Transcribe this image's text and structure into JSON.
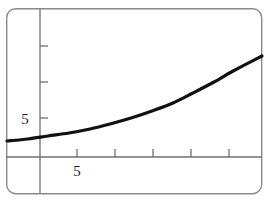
{
  "figure": {
    "frame": {
      "name": "rounded-figure-border",
      "x": 6,
      "y": 8,
      "width": 256,
      "height": 186,
      "radius": 9,
      "stroke": "#8a8a8a",
      "stroke_width": 1.4
    },
    "background": "#ffffff"
  },
  "chart_data": {
    "type": "line",
    "title": "",
    "subtitle": "",
    "xlabel": "",
    "ylabel": "",
    "grid": false,
    "legend": null,
    "annotations": [],
    "curve_color": "#111111",
    "curve_width": 3.2,
    "axis_color": "#6f6f6f",
    "axis_width": 1.3,
    "x_axis": {
      "name": "x-axis",
      "pixel_y": 157,
      "pixel_x_start": 6,
      "pixel_x_end": 262,
      "tick_pixels": [
        77,
        115,
        153,
        191,
        229
      ],
      "tick_length": 8,
      "tick_direction": "up",
      "labeled_ticks": [
        {
          "value": "5",
          "pixel_x": 77
        }
      ],
      "ticks_values": [
        5,
        10,
        15,
        20,
        25
      ],
      "range": [
        -9,
        28
      ]
    },
    "y_axis": {
      "name": "y-axis",
      "pixel_x": 40,
      "pixel_y_start": 12,
      "pixel_y_end": 193,
      "tick_pixels": [
        46,
        82,
        118
      ],
      "tick_length": 8,
      "tick_direction": "right",
      "labeled_ticks": [
        {
          "value": "5",
          "pixel_y": 118
        }
      ],
      "ticks_values": [
        15,
        10,
        5
      ],
      "range": [
        -5,
        20
      ]
    },
    "series": [
      {
        "name": "curve",
        "x": [
          -9,
          -6,
          -3,
          0,
          3,
          6,
          9,
          12,
          15,
          18,
          21,
          24,
          27
        ],
        "y": [
          2.2,
          2.6,
          3.1,
          3.7,
          4.4,
          5.3,
          6.4,
          7.7,
          9.3,
          11.2,
          13.5,
          16.2,
          19.5
        ],
        "points_pixels": [
          [
            7,
            141
          ],
          [
            28,
            139
          ],
          [
            48,
            136
          ],
          [
            69,
            133
          ],
          [
            90,
            129
          ],
          [
            110,
            124
          ],
          [
            131,
            118
          ],
          [
            152,
            111
          ],
          [
            173,
            103
          ],
          [
            193,
            93
          ],
          [
            214,
            82
          ],
          [
            235,
            70
          ],
          [
            262,
            56
          ]
        ]
      }
    ]
  },
  "labels": {
    "y_tick_5": "5",
    "x_tick_5": "5"
  }
}
